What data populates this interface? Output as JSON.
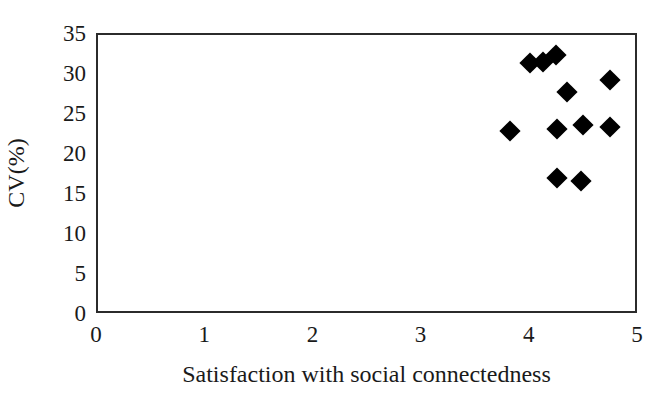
{
  "chart_data": {
    "type": "scatter",
    "title": "",
    "xlabel": "Satisfaction with social connectedness",
    "ylabel": "CV(%)",
    "xlim": [
      0,
      5
    ],
    "ylim": [
      0,
      35
    ],
    "xticks": [
      "0",
      "1",
      "2",
      "3",
      "4",
      "5"
    ],
    "xtick_values": [
      0,
      1,
      2,
      3,
      4,
      5
    ],
    "yticks": [
      "0",
      "5",
      "10",
      "15",
      "20",
      "25",
      "30",
      "35"
    ],
    "ytick_values": [
      0,
      5,
      10,
      15,
      20,
      25,
      30,
      35
    ],
    "grid": false,
    "legend": null,
    "marker_style": "filled-diamond",
    "marker_color": "#000000",
    "series": [
      {
        "name": "observations",
        "points": [
          {
            "x": 3.83,
            "y": 22.7
          },
          {
            "x": 4.01,
            "y": 31.2
          },
          {
            "x": 4.13,
            "y": 31.4
          },
          {
            "x": 4.25,
            "y": 32.2
          },
          {
            "x": 4.35,
            "y": 27.6
          },
          {
            "x": 4.26,
            "y": 23.0
          },
          {
            "x": 4.5,
            "y": 23.5
          },
          {
            "x": 4.75,
            "y": 23.3
          },
          {
            "x": 4.75,
            "y": 29.1
          },
          {
            "x": 4.26,
            "y": 16.9
          },
          {
            "x": 4.48,
            "y": 16.5
          }
        ]
      }
    ]
  },
  "style": {
    "axis_color": "#2b2b2b",
    "background": "#ffffff",
    "text_color": "#1a1a1a"
  }
}
